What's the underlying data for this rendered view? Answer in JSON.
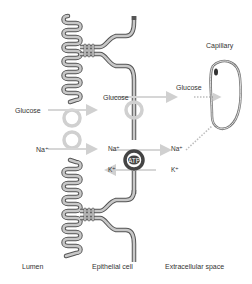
{
  "diagram": {
    "regions": {
      "lumen": "Lumen",
      "epithelial_cell": "Epithelial cell",
      "extracellular_space": "Extracellular space",
      "capillary": "Capillary"
    },
    "apical_transport": {
      "glucose_label": "Glucose",
      "sodium_label": "Na⁺"
    },
    "basolateral_glucose": {
      "left_label": "Glucose",
      "right_label": "Glucose"
    },
    "pump": {
      "atp_label": "ATP",
      "na_in_label": "Na⁺",
      "na_out_label": "Na⁺",
      "k_in_label": "K⁺",
      "k_out_label": "K⁺"
    },
    "colors": {
      "membrane_fill": "#c8c8c8",
      "membrane_stroke": "#555555",
      "transporter_ring": "#d0d0d0",
      "pump_ring": "#444444",
      "arrow": "#d6d6d6",
      "text": "#333333"
    }
  }
}
